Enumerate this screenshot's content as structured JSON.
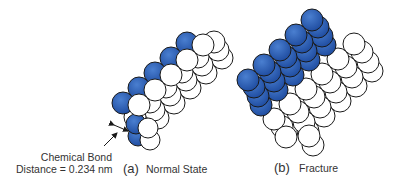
{
  "colors": {
    "blue": "#2f5fb3",
    "blue_dark": "#1d4a9e",
    "white": "#ffffff",
    "stroke": "#1a1a1a",
    "text": "#333333"
  },
  "panel_a": {
    "letter": "(a)",
    "title": "Normal State",
    "annotation_line1": "Chemical Bond",
    "annotation_line2": "Distance = 0.234 nm"
  },
  "panel_b": {
    "letter": "(b)",
    "title": "Fracture"
  }
}
